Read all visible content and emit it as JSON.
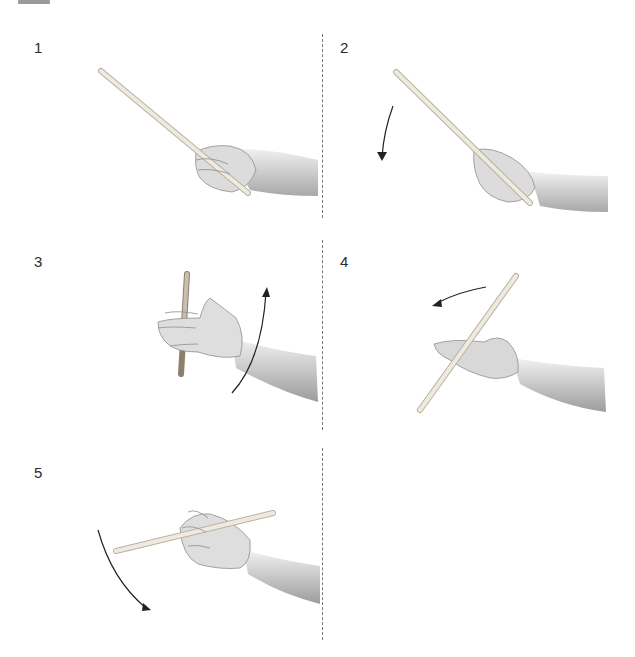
{
  "figure": {
    "steps": [
      {
        "number": "1",
        "description": "Hold stick, tip pointing up-left",
        "arrow": "none"
      },
      {
        "number": "2",
        "description": "Tip rotates downward",
        "arrow": "down"
      },
      {
        "number": "3",
        "description": "Stick vertical between fingers, hand rotates up",
        "arrow": "up"
      },
      {
        "number": "4",
        "description": "Stick crosses palm, rotate left",
        "arrow": "left"
      },
      {
        "number": "5",
        "description": "Stick horizontal across fingers, sweep down",
        "arrow": "down-curve"
      }
    ]
  },
  "colors": {
    "background": "#ffffff",
    "stick": "#ece7dc",
    "stick_outline": "#b9b2a4",
    "skin": "#e4e4e4",
    "skin_shadow": "#9c9c9c",
    "arrow": "#222222",
    "divider": "#777777"
  }
}
